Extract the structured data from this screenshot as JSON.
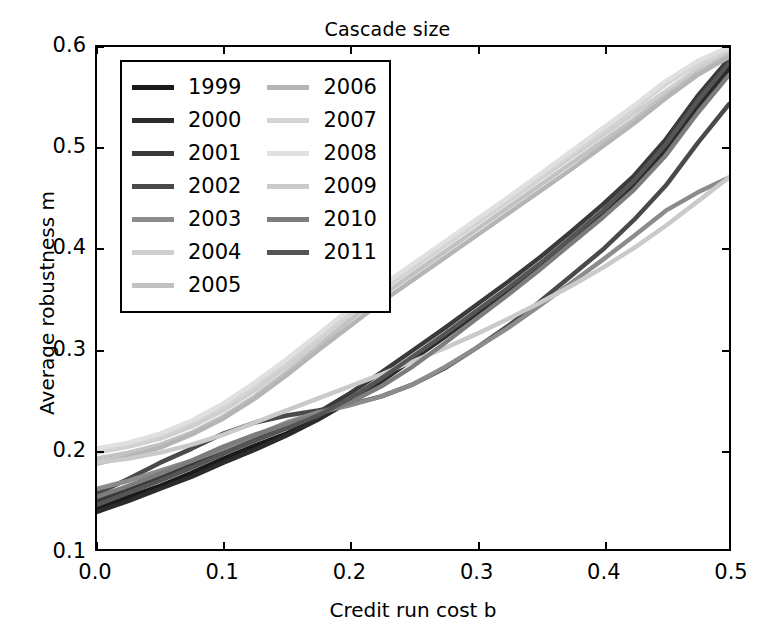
{
  "chart_data": {
    "type": "line",
    "title": "Cascade size",
    "xlabel": "Credit run cost b",
    "ylabel": "Average robustness m",
    "xlim": [
      0.0,
      0.5
    ],
    "ylim": [
      0.1,
      0.6
    ],
    "xticks": [
      "0.0",
      "0.1",
      "0.2",
      "0.3",
      "0.4",
      "0.5"
    ],
    "xtick_values": [
      0.0,
      0.1,
      0.2,
      0.3,
      0.4,
      0.5
    ],
    "yticks": [
      "0.1",
      "0.2",
      "0.3",
      "0.4",
      "0.5",
      "0.6"
    ],
    "ytick_values": [
      0.1,
      0.2,
      0.3,
      0.4,
      0.5,
      0.6
    ],
    "grid": false,
    "legend_position": "upper left",
    "x": [
      0.0,
      0.025,
      0.05,
      0.075,
      0.1,
      0.125,
      0.15,
      0.175,
      0.2,
      0.225,
      0.25,
      0.275,
      0.3,
      0.325,
      0.35,
      0.375,
      0.4,
      0.425,
      0.45,
      0.475,
      0.5
    ],
    "series": [
      {
        "name": "1999",
        "color": "#1a1a1a",
        "values": [
          0.14,
          0.152,
          0.163,
          0.176,
          0.19,
          0.203,
          0.215,
          0.23,
          0.248,
          0.268,
          0.29,
          0.312,
          0.335,
          0.358,
          0.382,
          0.408,
          0.434,
          0.464,
          0.5,
          0.543,
          0.58
        ]
      },
      {
        "name": "2000",
        "color": "#2b2b2b",
        "values": [
          0.137,
          0.148,
          0.16,
          0.172,
          0.186,
          0.199,
          0.213,
          0.229,
          0.247,
          0.267,
          0.289,
          0.311,
          0.334,
          0.357,
          0.381,
          0.407,
          0.433,
          0.462,
          0.498,
          0.54,
          0.577
        ]
      },
      {
        "name": "2001",
        "color": "#3a3a3a",
        "values": [
          0.148,
          0.16,
          0.172,
          0.184,
          0.197,
          0.209,
          0.221,
          0.236,
          0.255,
          0.276,
          0.298,
          0.32,
          0.343,
          0.366,
          0.39,
          0.416,
          0.443,
          0.472,
          0.508,
          0.551,
          0.588
        ]
      },
      {
        "name": "2002",
        "color": "#4a4a4a",
        "values": [
          0.155,
          0.17,
          0.186,
          0.2,
          0.215,
          0.226,
          0.233,
          0.238,
          0.244,
          0.252,
          0.264,
          0.28,
          0.3,
          0.322,
          0.346,
          0.372,
          0.398,
          0.428,
          0.462,
          0.504,
          0.543
        ]
      },
      {
        "name": "2003",
        "color": "#8c8c8c",
        "values": [
          0.16,
          0.168,
          0.178,
          0.188,
          0.2,
          0.213,
          0.226,
          0.236,
          0.243,
          0.252,
          0.264,
          0.281,
          0.3,
          0.32,
          0.342,
          0.365,
          0.388,
          0.412,
          0.437,
          0.455,
          0.47
        ]
      },
      {
        "name": "2004",
        "color": "#cfcfcf",
        "values": [
          0.196,
          0.202,
          0.21,
          0.222,
          0.238,
          0.258,
          0.282,
          0.308,
          0.334,
          0.358,
          0.38,
          0.402,
          0.424,
          0.446,
          0.468,
          0.49,
          0.512,
          0.534,
          0.556,
          0.578,
          0.596
        ]
      },
      {
        "name": "2005",
        "color": "#c2c2c2",
        "values": [
          0.19,
          0.196,
          0.204,
          0.216,
          0.232,
          0.252,
          0.276,
          0.302,
          0.328,
          0.352,
          0.374,
          0.396,
          0.418,
          0.44,
          0.462,
          0.484,
          0.506,
          0.528,
          0.552,
          0.574,
          0.592
        ]
      },
      {
        "name": "2006",
        "color": "#b5b5b5",
        "values": [
          0.185,
          0.192,
          0.201,
          0.214,
          0.23,
          0.25,
          0.273,
          0.298,
          0.322,
          0.346,
          0.368,
          0.39,
          0.412,
          0.434,
          0.456,
          0.478,
          0.501,
          0.524,
          0.549,
          0.572,
          0.59
        ]
      },
      {
        "name": "2007",
        "color": "#d4d4d4",
        "values": [
          0.198,
          0.204,
          0.213,
          0.226,
          0.243,
          0.263,
          0.286,
          0.311,
          0.336,
          0.359,
          0.381,
          0.403,
          0.425,
          0.447,
          0.47,
          0.493,
          0.516,
          0.539,
          0.563,
          0.583,
          0.598
        ]
      },
      {
        "name": "2008",
        "color": "#e0e0e0",
        "values": [
          0.2,
          0.206,
          0.215,
          0.228,
          0.245,
          0.266,
          0.289,
          0.314,
          0.339,
          0.362,
          0.384,
          0.406,
          0.428,
          0.45,
          0.473,
          0.496,
          0.519,
          0.542,
          0.566,
          0.586,
          0.6
        ]
      },
      {
        "name": "2009",
        "color": "#cacaca",
        "values": [
          0.186,
          0.19,
          0.196,
          0.204,
          0.214,
          0.226,
          0.238,
          0.25,
          0.262,
          0.274,
          0.287,
          0.3,
          0.314,
          0.329,
          0.345,
          0.362,
          0.38,
          0.4,
          0.422,
          0.446,
          0.47
        ]
      },
      {
        "name": "2010",
        "color": "#7d7d7d",
        "values": [
          0.152,
          0.163,
          0.175,
          0.188,
          0.202,
          0.214,
          0.224,
          0.234,
          0.246,
          0.262,
          0.282,
          0.305,
          0.329,
          0.353,
          0.378,
          0.404,
          0.43,
          0.458,
          0.492,
          0.534,
          0.572
        ]
      },
      {
        "name": "2011",
        "color": "#555555",
        "values": [
          0.144,
          0.156,
          0.168,
          0.181,
          0.195,
          0.208,
          0.22,
          0.233,
          0.25,
          0.27,
          0.292,
          0.314,
          0.337,
          0.36,
          0.384,
          0.41,
          0.437,
          0.467,
          0.503,
          0.546,
          0.584
        ]
      }
    ]
  },
  "legend": {
    "column_left": [
      "1999",
      "2000",
      "2001",
      "2002",
      "2003",
      "2004",
      "2005"
    ],
    "column_right": [
      "2006",
      "2007",
      "2008",
      "2009",
      "2010",
      "2011"
    ]
  },
  "axes": {
    "title": "Cascade size",
    "xlabel": "Credit run cost b",
    "ylabel": "Average robustness m"
  }
}
